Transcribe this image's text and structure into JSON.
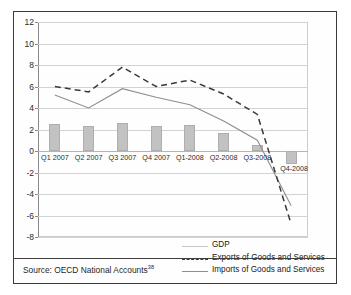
{
  "figure": {
    "source_prefix": "Source: OECD National Accounts",
    "source_footnote": "38"
  },
  "legend": {
    "position": "bottom-right",
    "entries": [
      {
        "label": "GDP",
        "key": "light-gray-line",
        "color": "#c8c8c8"
      },
      {
        "label": "Exports of Goods and Services",
        "key": "dark-dashed-line",
        "color": "#3a3a3a"
      },
      {
        "label": "Imports of Goods and Services",
        "key": "gray-solid-line",
        "color": "#8e8e8e"
      }
    ]
  },
  "chart_data": {
    "type": "bar",
    "title": "",
    "subtitle": "",
    "xlabel": "",
    "ylabel": "",
    "ylim": [
      -8,
      12
    ],
    "yticks": [
      12,
      10,
      8,
      6,
      4,
      2,
      0,
      -2,
      -4,
      -6,
      -8
    ],
    "grid": true,
    "categories": [
      "Q1 2007",
      "Q2 2007",
      "Q3 2007",
      "Q4 2007",
      "Q1-2008",
      "Q2-2008",
      "Q3-2008",
      "Q4-2008"
    ],
    "series": [
      {
        "name": "GDP",
        "render": "bar",
        "color": "#c2c2c2",
        "values": [
          2.5,
          2.3,
          2.6,
          2.3,
          2.4,
          1.7,
          0.6,
          -1.2
        ]
      },
      {
        "name": "Exports of Goods and Services",
        "render": "dashed-line",
        "color": "#3a3a3a",
        "values": [
          6.0,
          5.5,
          7.8,
          6.0,
          6.6,
          5.3,
          3.4,
          -6.8
        ]
      },
      {
        "name": "Imports of Goods and Services",
        "render": "line",
        "color": "#8e8e8e",
        "values": [
          5.2,
          4.0,
          5.8,
          5.0,
          4.3,
          2.8,
          1.0,
          -5.1
        ]
      }
    ]
  }
}
